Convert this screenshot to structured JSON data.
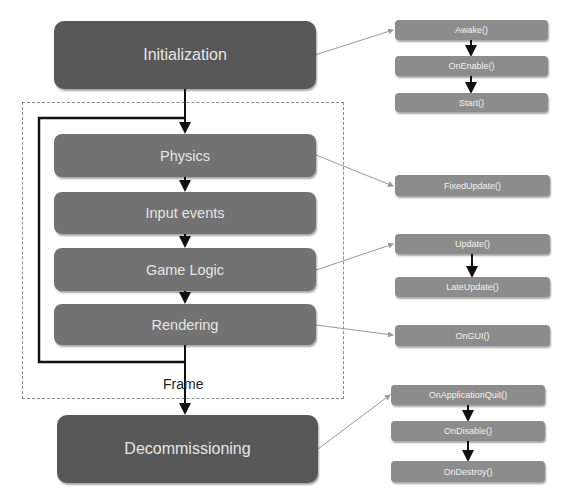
{
  "diagram": {
    "frame_label": "Frame",
    "main_flow": [
      {
        "id": "initialization",
        "label": "Initialization"
      },
      {
        "id": "physics",
        "label": "Physics"
      },
      {
        "id": "input-events",
        "label": "Input events"
      },
      {
        "id": "game-logic",
        "label": "Game Logic"
      },
      {
        "id": "rendering",
        "label": "Rendering"
      },
      {
        "id": "decommissioning",
        "label": "Decommissioning"
      }
    ],
    "callbacks": {
      "initialization": [
        "Awake()",
        "OnEnable()",
        "Start()"
      ],
      "physics": [
        "FixedUpdate()"
      ],
      "game_logic": [
        "Update()",
        "LateUpdate()"
      ],
      "rendering": [
        "OnGUI()"
      ],
      "decommissioning": [
        "OnApplicationQuit()",
        "OnDisable()",
        "OnDestroy()"
      ]
    },
    "colors": {
      "major_box": "#585858",
      "stage_box": "#727272",
      "callback_box": "#8c8c8c",
      "text": "#e6e6e6",
      "arrow": "#111111",
      "connector": "#999999"
    }
  }
}
